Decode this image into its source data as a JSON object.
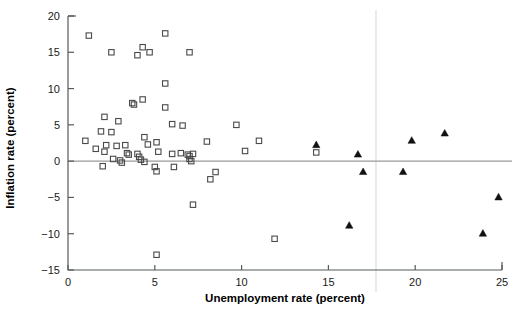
{
  "chart_data": {
    "type": "scatter",
    "title": "",
    "xlabel": "Unemployment rate (percent)",
    "ylabel": "Inflation rate (percent)",
    "xlim": [
      0,
      25
    ],
    "ylim": [
      -15,
      20
    ],
    "xticks": [
      0,
      5,
      10,
      15,
      20,
      25
    ],
    "yticks": [
      -15,
      -10,
      -5,
      0,
      5,
      10,
      15,
      20
    ],
    "xtick_labels": [
      "0",
      "5",
      "10",
      "15",
      "20",
      "25"
    ],
    "ytick_labels": [
      "−15",
      "−10",
      "−5",
      "0",
      "5",
      "10",
      "15",
      "20"
    ],
    "grid": false,
    "legend": "none",
    "annotations": [
      "horizontal reference line at inflation rate 0"
    ],
    "series": [
      {
        "name": "open-square-group",
        "marker": "open-square",
        "color": "#4a4a4a",
        "points": [
          [
            1.2,
            17.3
          ],
          [
            2.5,
            15.0
          ],
          [
            4.3,
            15.7
          ],
          [
            4.0,
            14.6
          ],
          [
            4.7,
            15.0
          ],
          [
            5.6,
            17.6
          ],
          [
            7.0,
            15.0
          ],
          [
            5.6,
            10.7
          ],
          [
            3.7,
            8.0
          ],
          [
            3.8,
            7.8
          ],
          [
            4.3,
            8.5
          ],
          [
            5.6,
            7.4
          ],
          [
            2.1,
            6.1
          ],
          [
            2.9,
            5.5
          ],
          [
            6.0,
            5.1
          ],
          [
            6.6,
            4.9
          ],
          [
            9.7,
            5.0
          ],
          [
            1.9,
            4.1
          ],
          [
            2.5,
            4.0
          ],
          [
            1.0,
            2.8
          ],
          [
            1.6,
            1.7
          ],
          [
            2.2,
            2.2
          ],
          [
            2.1,
            1.3
          ],
          [
            2.8,
            2.1
          ],
          [
            3.3,
            2.2
          ],
          [
            4.4,
            3.3
          ],
          [
            4.6,
            2.3
          ],
          [
            5.1,
            2.6
          ],
          [
            8.0,
            2.7
          ],
          [
            11.0,
            2.8
          ],
          [
            14.3,
            1.2
          ],
          [
            3.4,
            1.1
          ],
          [
            3.5,
            0.9
          ],
          [
            4.0,
            1.0
          ],
          [
            4.1,
            0.6
          ],
          [
            5.2,
            1.3
          ],
          [
            6.0,
            1.0
          ],
          [
            6.5,
            1.1
          ],
          [
            6.9,
            0.9
          ],
          [
            7.0,
            0.7
          ],
          [
            7.2,
            1.0
          ],
          [
            10.2,
            1.4
          ],
          [
            2.6,
            0.3
          ],
          [
            3.0,
            0.1
          ],
          [
            3.1,
            -0.2
          ],
          [
            4.2,
            0.2
          ],
          [
            4.4,
            -0.1
          ],
          [
            7.0,
            0.3
          ],
          [
            7.1,
            0.0
          ],
          [
            2.0,
            -0.7
          ],
          [
            5.0,
            -0.8
          ],
          [
            5.1,
            -1.4
          ],
          [
            6.1,
            -0.8
          ],
          [
            8.5,
            -1.5
          ],
          [
            8.2,
            -2.5
          ],
          [
            7.2,
            -6.0
          ],
          [
            11.9,
            -10.7
          ],
          [
            5.1,
            -12.9
          ]
        ]
      },
      {
        "name": "filled-triangle-group",
        "marker": "filled-triangle",
        "color": "#111111",
        "points": [
          [
            14.3,
            2.2
          ],
          [
            16.7,
            0.9
          ],
          [
            17.0,
            -1.5
          ],
          [
            19.3,
            -1.5
          ],
          [
            19.8,
            2.8
          ],
          [
            21.7,
            3.8
          ],
          [
            16.2,
            -8.9
          ],
          [
            23.9,
            -10.0
          ],
          [
            24.8,
            -5.0
          ]
        ]
      }
    ]
  }
}
